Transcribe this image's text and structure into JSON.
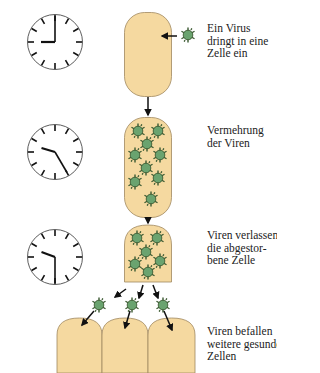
{
  "colors": {
    "cell_fill": "#f5d9a0",
    "cell_stroke": "#a08860",
    "virus_fill": "#6aa36f",
    "virus_stroke": "#3c5a32",
    "arrow": "#111111",
    "clock_stroke": "#111111"
  },
  "steps": [
    {
      "id": "step-1",
      "clock": {
        "hour": 9,
        "minute": 0
      },
      "caption": "Ein Virus\ndringt in eine\nZelle ein"
    },
    {
      "id": "step-2",
      "clock": {
        "hour": 9,
        "minute": 25
      },
      "caption": "Vermehrung\nder Viren"
    },
    {
      "id": "step-3",
      "clock": {
        "hour": 9,
        "minute": 30
      },
      "caption": "Viren verlassen\ndie abgestor-\nbene Zelle"
    },
    {
      "id": "step-4",
      "caption": "Viren befallen\nweitere gesunde\nZellen"
    }
  ],
  "icons": {
    "clock": "clock-icon",
    "virus": "virus-icon",
    "arrow": "arrow-icon"
  }
}
